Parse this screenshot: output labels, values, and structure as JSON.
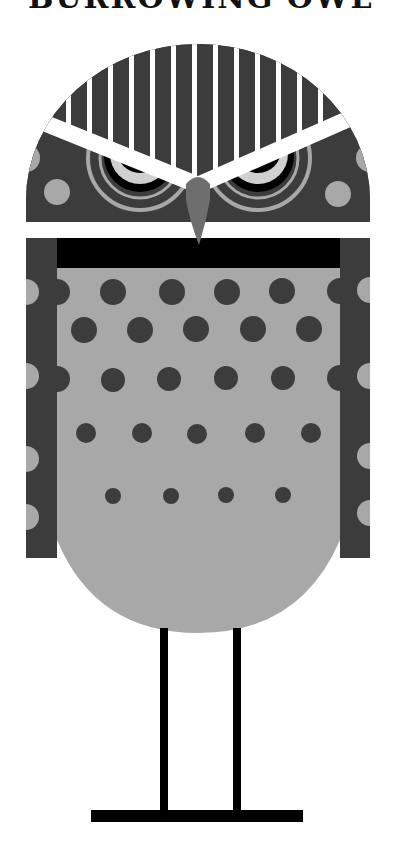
{
  "title": "BURROWING OWL",
  "illustration": {
    "subject": "owl",
    "colors": {
      "background": "#ffffff",
      "dark": "#3c3c3c",
      "light": "#a8a8a8",
      "eye_light": "#d0d0d0",
      "beak": "#6e6e6e",
      "black": "#000000",
      "white": "#ffffff"
    }
  }
}
